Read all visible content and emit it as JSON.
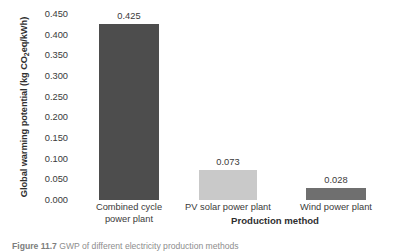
{
  "chart_data": {
    "type": "bar",
    "title": "",
    "xlabel": "Production method",
    "ylabel": "Global warming potential (kg CO2eq/kWh)",
    "ylabel_parts": {
      "before": "Global warming potential (kg CO",
      "sub": "2",
      "after": "eq/kWh)"
    },
    "categories": [
      "Combined cycle power plant",
      "PV solar power plant",
      "Wind power plant"
    ],
    "category_lines": [
      [
        "Combined cycle",
        "power plant"
      ],
      [
        "PV solar power plant"
      ],
      [
        "Wind power plant"
      ]
    ],
    "values": [
      0.425,
      0.073,
      0.028
    ],
    "value_labels": [
      "0.425",
      "0.073",
      "0.028"
    ],
    "bar_colors": [
      "#4d4d4d",
      "#c9c9c9",
      "#6f6f6f"
    ],
    "ylim": [
      0.0,
      0.45
    ],
    "yticks": [
      0.0,
      0.05,
      0.1,
      0.15,
      0.2,
      0.25,
      0.3,
      0.35,
      0.4,
      0.45
    ],
    "ytick_labels": [
      "0.000",
      "0.050",
      "0.100",
      "0.150",
      "0.200",
      "0.250",
      "0.300",
      "0.350",
      "0.400",
      "0.450"
    ],
    "grid": false,
    "legend": "none"
  },
  "caption": {
    "label": "Figure 11.7",
    "text": "GWP of different electricity production methods"
  }
}
